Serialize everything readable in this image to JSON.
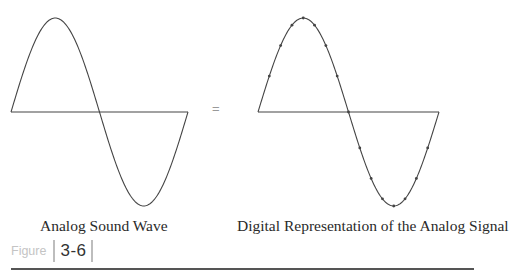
{
  "figure": {
    "word": "Figure",
    "number": "3-6"
  },
  "panels": [
    {
      "caption": "Analog Sound Wave",
      "type": "continuous"
    },
    {
      "caption": "Digital Representation of the Analog Signal",
      "type": "sampled"
    }
  ],
  "equals_sign": "=",
  "colors": {
    "wave": "#444444",
    "figure_word": "#c4c4c4",
    "figure_number": "#333333",
    "rule": "#555555"
  },
  "chart_data": {
    "type": "line",
    "title": "",
    "series": [
      {
        "name": "Analog Sound Wave",
        "function": "sine",
        "cycles": 1,
        "samples": 0
      },
      {
        "name": "Digital Representation of the Analog Signal",
        "function": "sine",
        "cycles": 1,
        "samples": 16
      }
    ],
    "xlabel": "",
    "ylabel": "",
    "ylim": [
      -1,
      1
    ],
    "grid": false
  }
}
